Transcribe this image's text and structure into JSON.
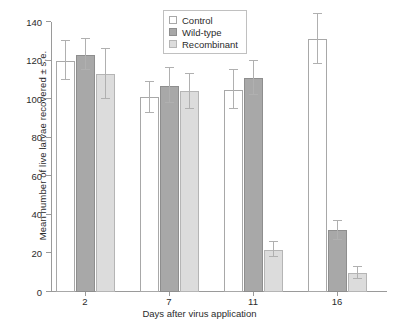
{
  "chart_data": {
    "type": "bar",
    "title": "",
    "xlabel": "Days after virus application",
    "ylabel": "Mean number of live larvae recovered ± s.e.",
    "categories": [
      "2",
      "7",
      "11",
      "16"
    ],
    "ylim": [
      0,
      140
    ],
    "yticks": [
      0,
      20,
      40,
      60,
      80,
      100,
      120,
      140
    ],
    "grid": false,
    "legend_position": "top-center",
    "series": [
      {
        "name": "Control",
        "color": "#ffffff",
        "edge_color": "#a8a8a8",
        "values": [
          120,
          101,
          105,
          131
        ],
        "errors": [
          10,
          8,
          10,
          13
        ]
      },
      {
        "name": "Wild-type",
        "color": "#a8a8a8",
        "edge_color": "#8e8e8e",
        "values": [
          123,
          107,
          111,
          32
        ],
        "errors": [
          8,
          9,
          9,
          5
        ]
      },
      {
        "name": "Recombinant",
        "color": "#dcdcdc",
        "edge_color": "#b5b5b5",
        "values": [
          113,
          104,
          22,
          10
        ],
        "errors": [
          13,
          9,
          4,
          3
        ]
      }
    ]
  },
  "axes": {
    "y_tick_labels": [
      "0",
      "20",
      "40",
      "60",
      "80",
      "100",
      "120",
      "140"
    ],
    "x_tick_labels": [
      "2",
      "7",
      "11",
      "16"
    ],
    "y_axis_title": "Mean number of live larvae recovered ± s.e.",
    "x_axis_title": "Days after virus application"
  },
  "legend": {
    "entries": [
      {
        "label": "Control"
      },
      {
        "label": "Wild-type"
      },
      {
        "label": "Recombinant"
      }
    ]
  }
}
